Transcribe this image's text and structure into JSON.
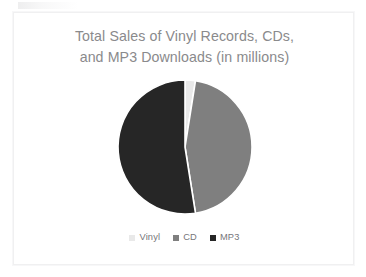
{
  "card": {
    "title": "Total Sales of Vinyl Records, CDs,\nand MP3 Downloads (in millions)"
  },
  "chart_data": {
    "type": "pie",
    "title": "Total Sales of Vinyl Records, CDs, and MP3 Downloads (in millions)",
    "xlabel": "",
    "ylabel": "",
    "legend_position": "bottom",
    "grid": false,
    "categories": [
      "Vinyl",
      "CD",
      "MP3"
    ],
    "values": [
      2.5,
      45.0,
      52.5
    ],
    "units": "millions",
    "slice_colors": [
      "#e9e9e9",
      "#7f7f7f",
      "#262626"
    ],
    "start_angle_deg": 0,
    "direction": "clockwise",
    "slices": [
      {
        "label": "Vinyl",
        "value": 2.5,
        "percent": 2.5,
        "color": "#e9e9e9",
        "start_deg": 0,
        "end_deg": 9
      },
      {
        "label": "CD",
        "value": 45.0,
        "percent": 45.0,
        "color": "#7f7f7f",
        "start_deg": 9,
        "end_deg": 171
      },
      {
        "label": "MP3",
        "value": 52.5,
        "percent": 52.5,
        "color": "#262626",
        "start_deg": 171,
        "end_deg": 360
      }
    ]
  },
  "legend": {
    "items": [
      {
        "label": "Vinyl",
        "color": "#e9e9e9"
      },
      {
        "label": "CD",
        "color": "#7f7f7f"
      },
      {
        "label": "MP3",
        "color": "#262626"
      }
    ]
  }
}
